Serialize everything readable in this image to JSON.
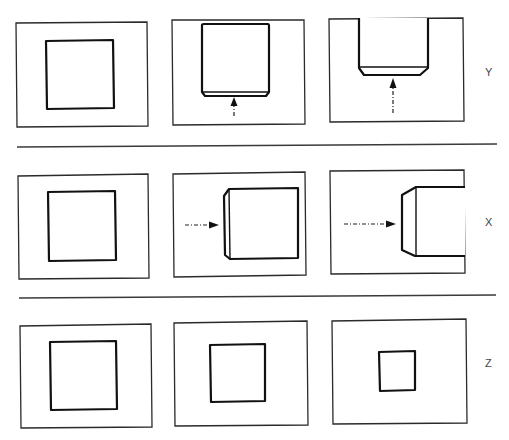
{
  "diagram": {
    "rows": [
      {
        "axis_label": "Y",
        "panels": [
          {
            "description": "square, no motion"
          },
          {
            "description": "square with chamfered bottom edge, arrow pointing up"
          },
          {
            "description": "part extends beyond top, chamfered bottom edge, long arrow pointing up"
          }
        ]
      },
      {
        "axis_label": "X",
        "panels": [
          {
            "description": "square, no motion"
          },
          {
            "description": "square with chamfered left edge, arrow pointing right"
          },
          {
            "description": "part extends beyond right, chamfered left edge, long arrow pointing right"
          }
        ]
      },
      {
        "axis_label": "Z",
        "panels": [
          {
            "description": "large square"
          },
          {
            "description": "medium square"
          },
          {
            "description": "small square"
          }
        ]
      }
    ],
    "colors": {
      "stroke": "#111111",
      "background": "#ffffff",
      "label": "#444444"
    }
  }
}
